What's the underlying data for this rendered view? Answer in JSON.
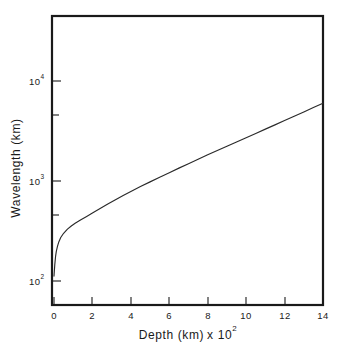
{
  "chart_data": {
    "type": "line",
    "title": "",
    "subtitle": "",
    "xlabel": "Depth  (km) x 10",
    "xlabel_exponent": "2",
    "xlabel_full": "Depth (km) x 10^2",
    "ylabel": "Wavelength  (km)",
    "ylabel_full": "Wavelength (km)",
    "x_scale": "linear",
    "y_scale": "log",
    "xlim": [
      0,
      14
    ],
    "ylim": [
      50,
      50000
    ],
    "grid": false,
    "legend": false,
    "legend_position": "none",
    "x_ticks": [
      {
        "value": 0,
        "label": "0"
      },
      {
        "value": 2,
        "label": "2"
      },
      {
        "value": 4,
        "label": "4"
      },
      {
        "value": 6,
        "label": "6"
      },
      {
        "value": 8,
        "label": "8"
      },
      {
        "value": 10,
        "label": "10"
      },
      {
        "value": 12,
        "label": "12"
      },
      {
        "value": 14,
        "label": "14"
      }
    ],
    "x_tick_labels": [
      "0",
      "2",
      "4",
      "6",
      "8",
      "10",
      "12",
      "14"
    ],
    "y_ticks": [
      {
        "value": 100,
        "mantissa": "10",
        "exponent": "2",
        "major": true
      },
      {
        "value": 500,
        "mantissa": "",
        "exponent": "",
        "major": false
      },
      {
        "value": 1000,
        "mantissa": "10",
        "exponent": "3",
        "major": true
      },
      {
        "value": 5000,
        "mantissa": "",
        "exponent": "",
        "major": false
      },
      {
        "value": 10000,
        "mantissa": "10",
        "exponent": "4",
        "major": true
      }
    ],
    "y_tick_labels": [
      "10^2",
      "10^3",
      "10^4"
    ],
    "series": [
      {
        "name": "wavelength",
        "color": "#2a2a2a",
        "x": [
          0.0,
          0.04,
          0.08,
          0.12,
          0.18,
          0.25,
          0.35,
          0.5,
          0.7,
          0.9,
          1.1,
          1.4,
          1.7,
          2.0,
          2.4,
          2.8,
          3.2,
          3.6,
          4.0,
          4.5,
          5.0,
          5.5,
          6.0,
          6.5,
          7.0,
          7.5,
          8.0,
          8.5,
          9.0,
          9.5,
          10.0,
          10.5,
          11.0,
          11.5,
          12.0,
          12.5,
          13.0,
          13.5,
          14.0
        ],
        "y": [
          112,
          145,
          175,
          198,
          222,
          246,
          272,
          300,
          330,
          355,
          378,
          410,
          442,
          478,
          530,
          588,
          650,
          716,
          786,
          880,
          980,
          1090,
          1210,
          1345,
          1490,
          1650,
          1830,
          2020,
          2230,
          2460,
          2710,
          2990,
          3300,
          3640,
          4020,
          4440,
          4900,
          5420,
          6000
        ]
      }
    ],
    "annotations": []
  },
  "axes": {
    "y_title": "Wavelength  (km)",
    "x_title_main": "Depth  (km)",
    "x_title_mult": "x 10",
    "x_title_exp": "2",
    "tick_10_2_mantissa": "10",
    "tick_10_2_exp": "2",
    "tick_10_3_mantissa": "10",
    "tick_10_3_exp": "3",
    "tick_10_4_mantissa": "10",
    "tick_10_4_exp": "4",
    "x_label_0": "0",
    "x_label_2": "2",
    "x_label_4": "4",
    "x_label_6": "6",
    "x_label_8": "8",
    "x_label_10": "10",
    "x_label_12": "12",
    "x_label_14": "14"
  },
  "colors": {
    "curve": "#2a2a2a",
    "frame": "#1a1a1a",
    "text": "#1a1a1a",
    "background": "#ffffff"
  }
}
